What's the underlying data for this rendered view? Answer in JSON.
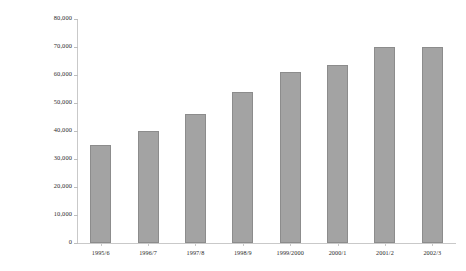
{
  "chart_data": {
    "type": "bar",
    "title": "",
    "xlabel": "",
    "ylabel": "Number of Appeals Lodged",
    "categories": [
      "1995/6",
      "1996/7",
      "1997/8",
      "1998/9",
      "1999/2000",
      "2000/1",
      "2001/2",
      "2002/3"
    ],
    "values": [
      35000,
      40000,
      46000,
      54000,
      61000,
      63500,
      70000,
      70000
    ],
    "ylim": [
      0,
      80000
    ],
    "yticks": [
      0,
      10000,
      20000,
      30000,
      40000,
      50000,
      60000,
      70000,
      80000
    ],
    "ytick_labels": [
      "0",
      "10,000",
      "20,000",
      "30,000",
      "40,000",
      "50,000",
      "60,000",
      "70,000",
      "80,000"
    ],
    "grid": false,
    "legend": null,
    "bar_color": "#a3a3a3",
    "bar_edge_color": "#8c8c8c",
    "axis_color": "#c9c9c9"
  }
}
